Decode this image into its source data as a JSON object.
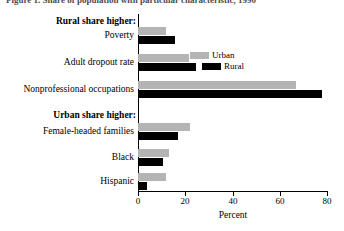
{
  "figure": {
    "title": "Figure 1. Share of population with particular characteristic, 1990",
    "x_axis_title": "Percent"
  },
  "groups": [
    {
      "id": "rural-higher",
      "heading": "Rural share higher:"
    },
    {
      "id": "urban-higher",
      "heading": "Urban share higher:"
    }
  ],
  "legend": {
    "position": "inside-upper-middle",
    "entries": [
      {
        "label": "Urban",
        "color": "#b4b4b4"
      },
      {
        "label": "Rural",
        "color": "#000000"
      }
    ]
  },
  "chart_data": {
    "type": "bar",
    "orientation": "horizontal",
    "title": "Figure 1. Share of population with particular characteristic, 1990",
    "xlabel": "Percent",
    "ylabel": "",
    "xlim": [
      0,
      80
    ],
    "xticks": [
      0,
      20,
      40,
      60,
      80
    ],
    "xtick_labels": [
      "0",
      "20",
      "40",
      "60",
      "80"
    ],
    "grid": false,
    "legend_position": "upper-middle-inside",
    "categories": [
      "Poverty",
      "Adult dropout rate",
      "Nonprofessional occupations",
      "Female-headed families",
      "Black",
      "Hispanic"
    ],
    "category_groups": [
      "Rural share higher:",
      "Rural share higher:",
      "Rural share higher:",
      "Urban share higher:",
      "Urban share higher:",
      "Urban share higher:"
    ],
    "series": [
      {
        "name": "Urban",
        "color": "#b4b4b4",
        "values": [
          12,
          21.5,
          67,
          22,
          13,
          12
        ]
      },
      {
        "name": "Rural",
        "color": "#000000",
        "values": [
          15.5,
          24.5,
          78,
          17,
          10.5,
          4
        ]
      }
    ]
  },
  "bars": [
    {
      "category": "Poverty",
      "label_top": 30,
      "urban_top": 27,
      "rural_top": 36,
      "urban": 12,
      "rural": 15.5
    },
    {
      "category": "Adult dropout rate",
      "label_top": 57,
      "urban_top": 54,
      "rural_top": 63,
      "urban": 21.5,
      "rural": 24.5
    },
    {
      "category": "Nonprofessional occupations",
      "label_top": 84,
      "urban_top": 81,
      "rural_top": 90,
      "urban": 67,
      "rural": 78
    },
    {
      "category": "Female-headed families",
      "label_top": 126,
      "urban_top": 123,
      "rural_top": 132,
      "urban": 22,
      "rural": 17
    },
    {
      "category": "Black",
      "label_top": 152,
      "urban_top": 149,
      "rural_top": 158,
      "urban": 13,
      "rural": 10.5
    },
    {
      "category": "Hispanic",
      "label_top": 176,
      "urban_top": 173,
      "rural_top": 182,
      "urban": 12,
      "rural": 4
    }
  ],
  "axis": {
    "x0_px": 138,
    "px_per_unit": 2.3625,
    "ticks": [
      {
        "value": 0,
        "label": "0",
        "x": 138
      },
      {
        "value": 20,
        "label": "20",
        "x": 185
      },
      {
        "value": 40,
        "label": "40",
        "x": 233
      },
      {
        "value": 60,
        "label": "60",
        "x": 280
      },
      {
        "value": 80,
        "label": "80",
        "x": 327
      }
    ]
  }
}
